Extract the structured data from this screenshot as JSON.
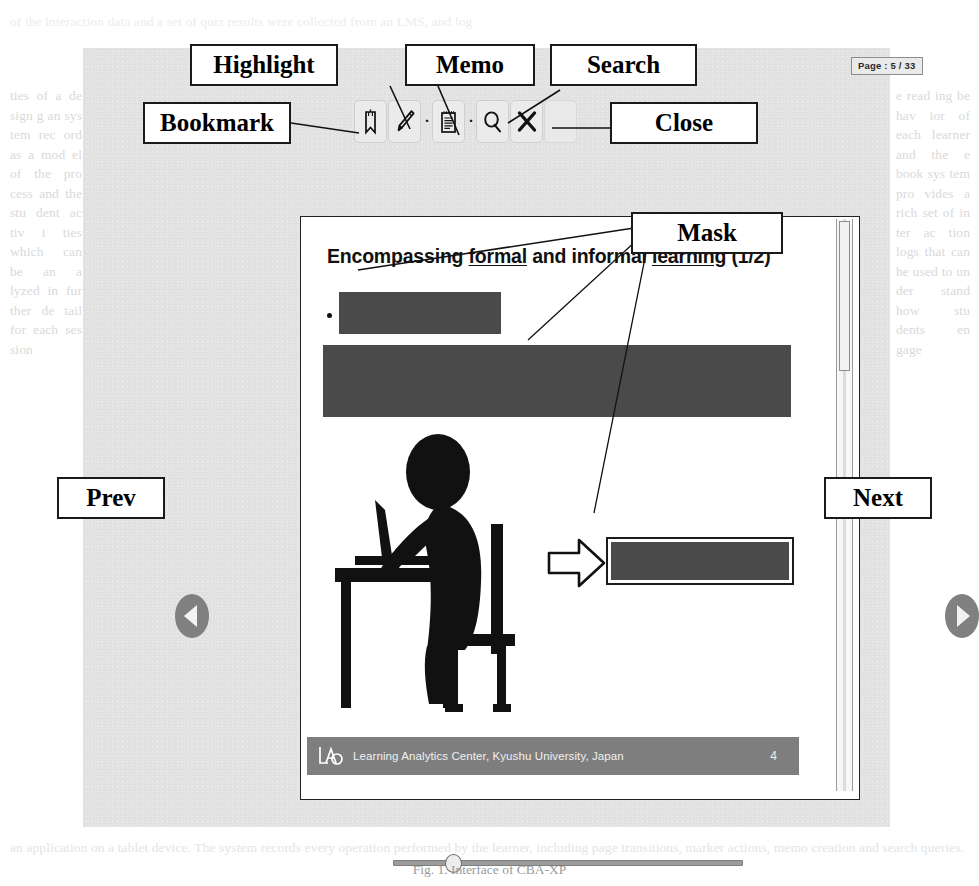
{
  "app": {
    "page_indicator": "Page : 5 / 33"
  },
  "toolbar": {
    "buttons": [
      {
        "label": "Bookmark",
        "icon": "bookmark-icon"
      },
      {
        "label": "Highlight",
        "icon": "pencil-highlight-icon"
      },
      {
        "label": "Memo",
        "icon": "notepad-memo-icon"
      },
      {
        "label": "Search",
        "icon": "magnifier-search-icon"
      },
      {
        "label": "Close",
        "icon": "close-x-icon"
      }
    ],
    "dropdown_dot": "·"
  },
  "callouts": {
    "highlight": "Highlight",
    "memo": "Memo",
    "search": "Search",
    "bookmark": "Bookmark",
    "close": "Close",
    "mask": "Mask"
  },
  "navigation": {
    "prev_label": "Prev",
    "next_label": "Next",
    "prev_icon": "triangle-left-icon",
    "next_icon": "triangle-right-icon"
  },
  "slide": {
    "title_part1": "Encompassing ",
    "title_underline1": "formal",
    "title_part2": " and informal ",
    "title_underline2": "learning",
    "title_part3": " (1/2)",
    "title_full": "Encompassing formal and informal learning (1/2)",
    "footer_text": "Learning Analytics Center, Kyushu University, Japan",
    "footer_number": "4",
    "footer_logo": "lac-logo",
    "masked_regions": 3,
    "pictogram": "student-writing-at-desk",
    "arrow": "right-arrow-icon"
  },
  "slider": {
    "position_percent": 17,
    "min": 1,
    "max": 33,
    "value": 5
  },
  "figure": {
    "caption": "Fig. 1. Interface of CBA-XP"
  },
  "colors": {
    "app_background": "#e3e3e3",
    "mask_fill": "#4a4a4a",
    "footer_band": "#7e7e7e",
    "nav_oval": "#808080",
    "callout_border": "#1a1a1a"
  },
  "ghost_page": {
    "top": "of the interaction data and a set of quiz results were collected from an LMS, and log",
    "left": "ties  of  a  de  sign  g  an  sys  tem  rec  ord  as  a  mod  el  of  the  pro  cess  and  the  stu  dent  ac  tiv  i  ties  which  can  be  an  a  lyzed  in  fur  ther  de  tail  for  each  ses  sion",
    "right": "e  read  ing  be  hav  ior  of  each  learner  and  the  e  book  sys  tem  pro  vides  a  rich  set  of  in  ter  ac  tion  logs  that  can  be  used  to  un  der  stand  how  stu  dents  en  gage",
    "body": "mode of learning. In this paper we describe the design of an e-book reader that supports both formal and informal learning activities, and we report on an evaluation with students. The reader records fine-grained interaction logs which are then analyzed by a learning analytics back-end in order to provide feedback to instructors about student engagement and reading behavior across sessions.",
    "bottom": "an application on a tablet device. The system records every operation performed by the learner, including page transitions, marker actions, memo creation and search queries."
  }
}
